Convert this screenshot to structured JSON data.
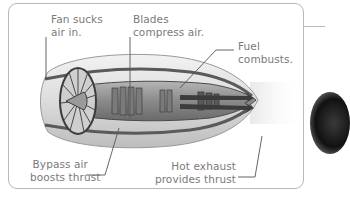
{
  "diagram": {
    "labels": {
      "fan": [
        "Fan sucks",
        "air in."
      ],
      "blades": [
        "Blades",
        "compress air."
      ],
      "fuel": [
        "Fuel",
        "combusts."
      ],
      "bypass": [
        "Bypass air",
        "boosts thrust"
      ],
      "exhaust": [
        "Hot exhaust",
        "provides thrust"
      ]
    },
    "colors": {
      "frame_border": "#b8b8b8",
      "label_text": "#7a7a7a",
      "leader_line": "#555555",
      "engine_body": "#9a9a9a",
      "engine_dark": "#3c3c3c"
    }
  }
}
